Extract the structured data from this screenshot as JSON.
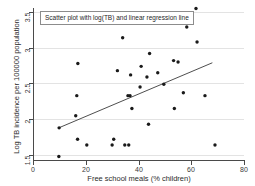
{
  "chart_data": {
    "type": "scatter",
    "title": "",
    "annotation": "Scatter plot with log(TB) and linear regression line",
    "xlabel": "Free school meals (% children)",
    "ylabel": "Log TB incidence per 100000 population",
    "xlim": [
      0,
      80
    ],
    "ylim": [
      1.42,
      3.58
    ],
    "xticks": [
      0,
      20,
      40,
      60,
      80
    ],
    "xtick_labels": [
      "0",
      "20",
      "40",
      "60",
      "80"
    ],
    "yticks": [
      1.5,
      2,
      2.5,
      3,
      3.5
    ],
    "ytick_labels": [
      "1.5",
      "2",
      "2.5",
      "3",
      "3.5"
    ],
    "grid": "horizontal",
    "legend": "none",
    "marker": "filled-circle",
    "marker_color": "#1a1a1a",
    "line_color": "#3a3a3a",
    "points": [
      {
        "x": 9.8,
        "y": 1.48
      },
      {
        "x": 9.9,
        "y": 1.88
      },
      {
        "x": 16.2,
        "y": 2.05
      },
      {
        "x": 16.6,
        "y": 2.33
      },
      {
        "x": 17.0,
        "y": 2.78
      },
      {
        "x": 16.9,
        "y": 1.72
      },
      {
        "x": 20.4,
        "y": 1.64
      },
      {
        "x": 30.0,
        "y": 1.64
      },
      {
        "x": 30.6,
        "y": 1.72
      },
      {
        "x": 32.0,
        "y": 2.68
      },
      {
        "x": 34.0,
        "y": 3.14
      },
      {
        "x": 34.8,
        "y": 1.64
      },
      {
        "x": 36.0,
        "y": 2.33
      },
      {
        "x": 36.3,
        "y": 1.64
      },
      {
        "x": 36.8,
        "y": 2.33
      },
      {
        "x": 37.0,
        "y": 2.62
      },
      {
        "x": 37.5,
        "y": 2.15
      },
      {
        "x": 40.6,
        "y": 2.45
      },
      {
        "x": 41.0,
        "y": 2.74
      },
      {
        "x": 43.2,
        "y": 2.59
      },
      {
        "x": 43.8,
        "y": 1.93
      },
      {
        "x": 44.2,
        "y": 2.92
      },
      {
        "x": 47.3,
        "y": 2.65
      },
      {
        "x": 49.6,
        "y": 2.49
      },
      {
        "x": 53.3,
        "y": 2.82
      },
      {
        "x": 53.6,
        "y": 2.15
      },
      {
        "x": 55.0,
        "y": 2.8
      },
      {
        "x": 57.0,
        "y": 2.37
      },
      {
        "x": 58.3,
        "y": 3.29
      },
      {
        "x": 61.8,
        "y": 3.55
      },
      {
        "x": 62.2,
        "y": 3.08
      },
      {
        "x": 65.2,
        "y": 2.33
      },
      {
        "x": 69.0,
        "y": 1.64
      }
    ],
    "regression_line": {
      "x_start": 9.8,
      "y_start": 1.88,
      "x_end": 68.0,
      "y_end": 2.79
    }
  }
}
